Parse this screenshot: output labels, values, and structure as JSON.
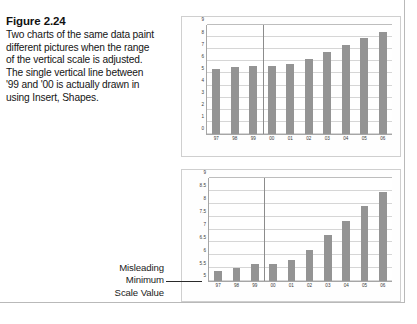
{
  "caption": {
    "figure_label": "Figure 2.24",
    "body": "Two charts of the same data paint different pictures when the range of the vertical scale is adjusted. The single vertical line between '99 and '00 is actually drawn in using Insert, Shapes."
  },
  "annotation": {
    "line1": "Misleading",
    "line2": "Minimum",
    "line3": "Scale Value"
  },
  "colors": {
    "bar_fill": "#949494",
    "gridline": "#d6d6d6",
    "axis": "#a6a6a6",
    "divider": "#8c8c8c",
    "chart_border": "#cfcfcf",
    "page_border": "#b9b9b9"
  },
  "chart_data": [
    {
      "id": "top-chart",
      "type": "bar",
      "title": "",
      "xlabel": "",
      "ylabel": "",
      "categories": [
        "97",
        "98",
        "99",
        "00",
        "01",
        "02",
        "03",
        "04",
        "05",
        "06"
      ],
      "values": [
        5.4,
        5.5,
        5.65,
        5.65,
        5.8,
        6.2,
        6.8,
        7.35,
        7.9,
        8.45
      ],
      "ylim": [
        0,
        9
      ],
      "yticks": [
        9,
        8,
        7,
        6,
        5,
        4,
        3,
        2,
        1,
        0
      ],
      "grid": true,
      "legend": "none",
      "annotations": [
        {
          "kind": "vertical-line",
          "between": [
            "99",
            "00"
          ],
          "note": "drawn with Insert, Shapes"
        }
      ]
    },
    {
      "id": "bottom-chart",
      "type": "bar",
      "title": "",
      "xlabel": "",
      "ylabel": "",
      "categories": [
        "97",
        "98",
        "99",
        "00",
        "01",
        "02",
        "03",
        "04",
        "05",
        "06"
      ],
      "values": [
        5.4,
        5.5,
        5.65,
        5.65,
        5.8,
        6.2,
        6.8,
        7.35,
        7.9,
        8.45
      ],
      "ylim": [
        5,
        9
      ],
      "yticks": [
        9,
        8.5,
        8,
        7.5,
        7,
        6.5,
        6,
        5.5,
        5
      ],
      "grid": true,
      "legend": "none",
      "annotations": [
        {
          "kind": "vertical-line",
          "between": [
            "99",
            "00"
          ],
          "note": "drawn with Insert, Shapes"
        },
        {
          "kind": "callout",
          "text": "Misleading Minimum Scale Value",
          "target": "y-axis-minimum"
        }
      ]
    }
  ]
}
